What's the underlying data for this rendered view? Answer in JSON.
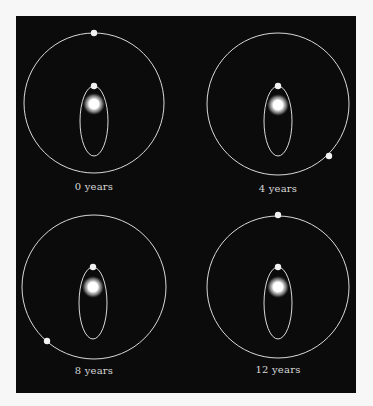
{
  "colors": {
    "page_background": "#f7f7f7",
    "frame_background": "#0b0b0b",
    "orbit_stroke": "#d9d9d9",
    "body_fill": "#f2f2f2",
    "star_core": "#ffffff",
    "label_text": "#d8d8d8"
  },
  "panels": [
    {
      "label": "0 years",
      "outer_orbit": {
        "cx": 94,
        "cy": 103,
        "r": 70
      },
      "inner_orbit": {
        "cx": 94,
        "cy": 121,
        "rx": 14,
        "ry": 35
      },
      "star": {
        "cx": 94,
        "cy": 104,
        "r": 8
      },
      "inner_body": {
        "cx": 94,
        "cy": 86
      },
      "outer_body": {
        "cx": 94,
        "cy": 33
      },
      "label_pos": {
        "x": 34,
        "y": 181
      }
    },
    {
      "label": "4 years",
      "outer_orbit": {
        "cx": 278,
        "cy": 104,
        "r": 71
      },
      "inner_orbit": {
        "cx": 278,
        "cy": 121,
        "rx": 14,
        "ry": 35
      },
      "star": {
        "cx": 278,
        "cy": 105,
        "r": 8
      },
      "inner_body": {
        "cx": 278,
        "cy": 86
      },
      "outer_body": {
        "cx": 329,
        "cy": 156
      },
      "label_pos": {
        "x": 218,
        "y": 183
      }
    },
    {
      "label": "8 years",
      "outer_orbit": {
        "cx": 94,
        "cy": 287,
        "r": 72
      },
      "inner_orbit": {
        "cx": 93,
        "cy": 303,
        "rx": 14,
        "ry": 36
      },
      "star": {
        "cx": 93,
        "cy": 287,
        "r": 8
      },
      "inner_body": {
        "cx": 93,
        "cy": 267
      },
      "outer_body": {
        "cx": 47,
        "cy": 341
      },
      "label_pos": {
        "x": 34,
        "y": 365
      }
    },
    {
      "label": "12 years",
      "outer_orbit": {
        "cx": 278,
        "cy": 287,
        "r": 71
      },
      "inner_orbit": {
        "cx": 278,
        "cy": 303,
        "rx": 14,
        "ry": 36
      },
      "star": {
        "cx": 278,
        "cy": 287,
        "r": 8
      },
      "inner_body": {
        "cx": 278,
        "cy": 267
      },
      "outer_body": {
        "cx": 278,
        "cy": 215
      },
      "label_pos": {
        "x": 218,
        "y": 364
      }
    }
  ]
}
